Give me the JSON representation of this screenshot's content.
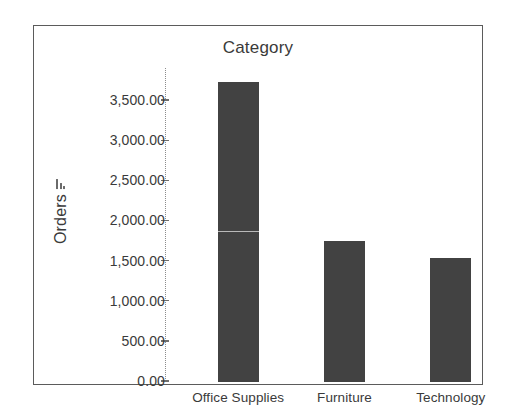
{
  "chart_data": {
    "type": "bar",
    "title": "Category",
    "xlabel": "",
    "ylabel": "Orders",
    "categories": [
      "Office Supplies",
      "Furniture",
      "Technology"
    ],
    "values": [
      3740,
      1760,
      1540
    ],
    "series": [
      {
        "name": "Orders",
        "values": [
          3740,
          1760,
          1540
        ]
      }
    ],
    "segment_boundaries": [
      1865,
      null,
      null
    ],
    "ylim": [
      0,
      3900
    ],
    "ytick_values": [
      0,
      500,
      1000,
      1500,
      2000,
      2500,
      3000,
      3500
    ],
    "ytick_labels": [
      "0.00",
      "500.00",
      "1,000.00",
      "1,500.00",
      "2,000.00",
      "2,500.00",
      "3,000.00",
      "3,500.00"
    ],
    "grid": false,
    "legend": null,
    "bar_color": "#424242",
    "axis_color": "#8c8c8c",
    "text_color": "#3a3a3a",
    "frame_color": "#5b5b5b",
    "y_axis_line_style": "dotted"
  },
  "axis": {
    "y_title_text": "Orders",
    "y_sort_icon": "bar-sort-icon"
  }
}
